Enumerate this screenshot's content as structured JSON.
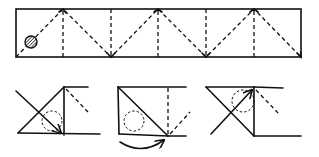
{
  "diagram": {
    "title": "",
    "colors": {
      "stroke": "#111111",
      "background": "#ffffff"
    },
    "strip": {
      "x": 16,
      "y": 9,
      "width": 285,
      "height": 48,
      "marker": {
        "shape": "hatched-circle",
        "cx": 31,
        "cy": 42,
        "r": 6
      },
      "vertical_creases_x": [
        63,
        111,
        158,
        206,
        254
      ],
      "zigzag_points": [
        [
          16,
          57
        ],
        [
          63,
          9
        ],
        [
          111,
          57
        ],
        [
          158,
          9
        ],
        [
          206,
          57
        ],
        [
          254,
          9
        ],
        [
          301,
          57
        ]
      ]
    },
    "steps": [
      {
        "label": "step-1",
        "description": "Fold diagonal across, arrow pointing down-right into corner, dashed circle marker"
      },
      {
        "label": "step-2",
        "description": "Triangle folded, curved arrow underneath indicating flip, dashed circle marker"
      },
      {
        "label": "step-3",
        "description": "Diagonal fold with arrow pointing up-right, dashed circle marker"
      }
    ]
  }
}
